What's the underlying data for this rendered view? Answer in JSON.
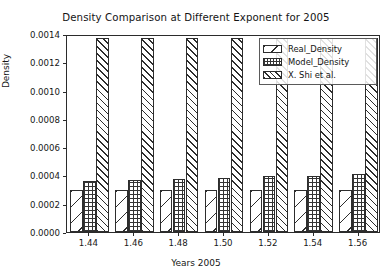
{
  "chart_data": {
    "type": "bar",
    "title": "Density Comparison at Different Exponent for 2005",
    "xlabel": "Years 2005",
    "ylabel": "Density",
    "categories": [
      "1.44",
      "1.46",
      "1.48",
      "1.50",
      "1.52",
      "1.54",
      "1.56"
    ],
    "series": [
      {
        "name": "Real_Density",
        "values": [
          0.0003,
          0.0003,
          0.0003,
          0.0003,
          0.0003,
          0.0003,
          0.0003
        ]
      },
      {
        "name": "Model_Density",
        "values": [
          0.000362,
          0.000368,
          0.000374,
          0.000383,
          0.000396,
          0.000393,
          0.000407
        ]
      },
      {
        "name": "X. Shi et al.",
        "values": [
          0.001372,
          0.001372,
          0.001372,
          0.001372,
          0.001372,
          0.001372,
          0.001372
        ]
      }
    ],
    "ylim": [
      0.0,
      0.0014
    ],
    "yticks": [
      0.0,
      0.0002,
      0.0004,
      0.0006,
      0.0008,
      0.001,
      0.0012,
      0.0014
    ],
    "ytick_labels": [
      "0.0000",
      "0.0002",
      "0.0004",
      "0.0006",
      "0.0008",
      "0.0010",
      "0.0012",
      "0.0014"
    ],
    "grid": false,
    "legend_position": "upper right",
    "hatches": [
      "sparse-backslash",
      "cross-grid",
      "dense-forward-diagonal"
    ],
    "colors": {
      "edge": "#2d2d2d",
      "face": "#ffffff",
      "axis": "#2b2b2b",
      "text": "#141414",
      "background": "#ffffff"
    }
  }
}
